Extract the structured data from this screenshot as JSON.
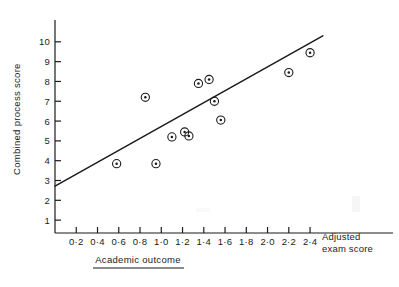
{
  "chart_data": {
    "type": "scatter",
    "title": "",
    "xlabel": "Academic outcome",
    "xlabel_right": "Adjusted",
    "xlabel_right2": "exam score",
    "ylabel": "Combined process score",
    "xlim": [
      0.0,
      2.55
    ],
    "ylim": [
      0.35,
      10.9
    ],
    "xticks": [
      "0·2",
      "0·4",
      "0·6",
      "0·8",
      "1·0",
      "1·2",
      "1·4",
      "1·6",
      "1·8",
      "2·0",
      "2·2",
      "2·4"
    ],
    "xtick_values": [
      0.2,
      0.4,
      0.6,
      0.8,
      1.0,
      1.2,
      1.4,
      1.6,
      1.8,
      2.0,
      2.2,
      2.4
    ],
    "yticks": [
      "1",
      "2",
      "3",
      "4",
      "5",
      "6",
      "7",
      "8",
      "9",
      "10"
    ],
    "ytick_values": [
      1,
      2,
      3,
      4,
      5,
      6,
      7,
      8,
      9,
      10
    ],
    "grid": false,
    "legend": "none",
    "marker": "circle-with-dot",
    "points": [
      {
        "x": 0.58,
        "y": 3.85
      },
      {
        "x": 0.85,
        "y": 7.2
      },
      {
        "x": 0.95,
        "y": 3.85
      },
      {
        "x": 1.1,
        "y": 5.2
      },
      {
        "x": 1.22,
        "y": 5.45
      },
      {
        "x": 1.26,
        "y": 5.25
      },
      {
        "x": 1.35,
        "y": 7.9
      },
      {
        "x": 1.45,
        "y": 8.1
      },
      {
        "x": 1.5,
        "y": 7.0
      },
      {
        "x": 1.56,
        "y": 6.05
      },
      {
        "x": 2.2,
        "y": 8.45
      },
      {
        "x": 2.4,
        "y": 9.45
      }
    ],
    "regression_line": {
      "x0": 0.0,
      "y0": 2.72,
      "x1": 2.52,
      "y1": 10.3
    },
    "colors": {
      "ink": "#1b1b1b",
      "background": "#ffffff"
    }
  }
}
